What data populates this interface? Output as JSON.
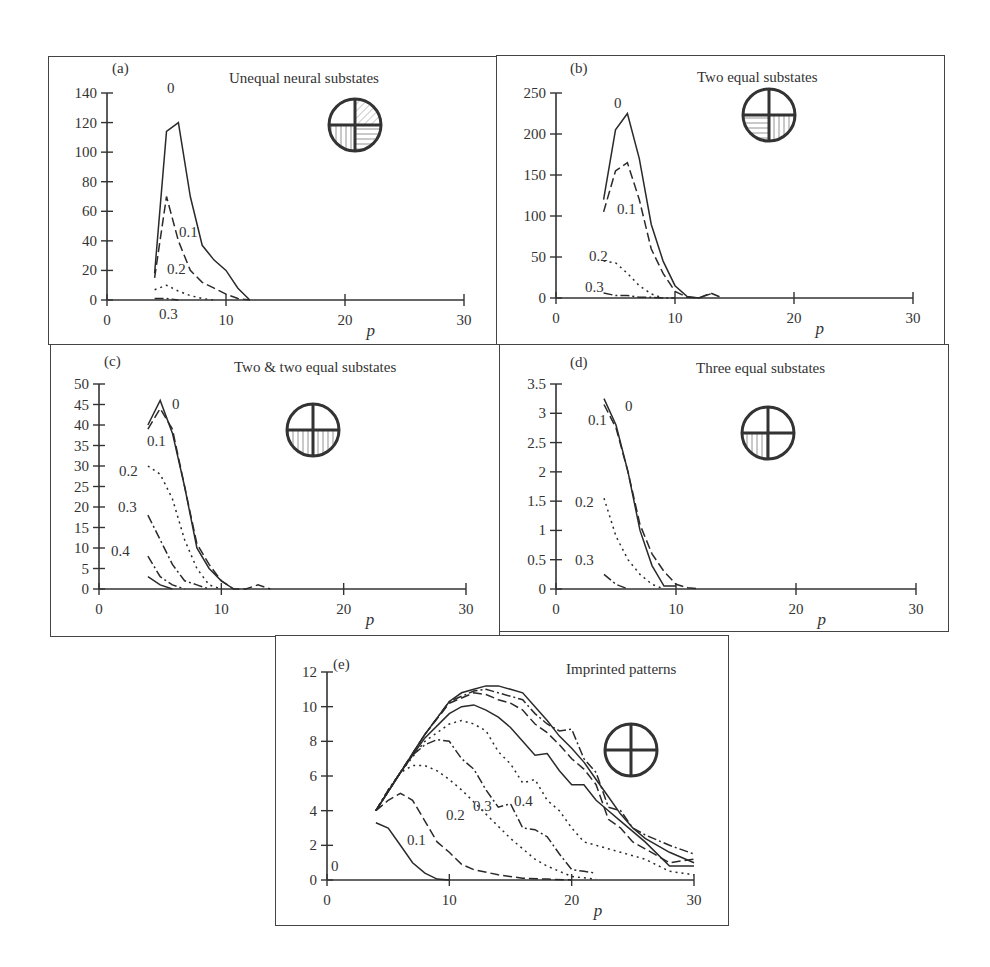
{
  "figure": {
    "panels": [
      {
        "id": "a",
        "label": "(a)",
        "title": "Unequal neural substates",
        "icon": "unequal-substates-icon"
      },
      {
        "id": "b",
        "label": "(b)",
        "title": "Two equal substates",
        "icon": "two-equal-substates-icon"
      },
      {
        "id": "c",
        "label": "(c)",
        "title": "Two & two equal substates",
        "icon": "two-and-two-equal-substates-icon"
      },
      {
        "id": "d",
        "label": "(d)",
        "title": "Three equal substates",
        "icon": "three-equal-substates-icon"
      },
      {
        "id": "e",
        "label": "(e)",
        "title": "Imprinted patterns",
        "icon": "imprinted-patterns-icon"
      }
    ],
    "xlabel": "p"
  },
  "chart_data": [
    {
      "panel": "(a)",
      "type": "line",
      "title": "Unequal neural substates",
      "xlabel": "p",
      "ylabel": "",
      "xlim": [
        0,
        30
      ],
      "ylim": [
        0,
        140
      ],
      "xticks": [
        0,
        10,
        20,
        30
      ],
      "yticks": [
        0,
        20,
        40,
        60,
        80,
        100,
        120,
        140
      ],
      "grid": false,
      "series": [
        {
          "name": "0",
          "style": "solid",
          "x": [
            4,
            5,
            6,
            7,
            8,
            9,
            10,
            11,
            12
          ],
          "values": [
            18,
            114,
            120,
            70,
            37,
            27,
            20,
            8,
            0
          ]
        },
        {
          "name": "0.1",
          "style": "dashed",
          "x": [
            4,
            5,
            6,
            7,
            8,
            9,
            10,
            11,
            12
          ],
          "values": [
            15,
            70,
            40,
            20,
            12,
            8,
            4,
            1,
            0
          ]
        },
        {
          "name": "0.2",
          "style": "dotted",
          "x": [
            4,
            5,
            6,
            7,
            8,
            9
          ],
          "values": [
            7,
            10,
            6,
            3,
            1,
            0
          ]
        },
        {
          "name": "0.3",
          "style": "dashdot",
          "x": [
            4,
            5,
            6
          ],
          "values": [
            1,
            1,
            0
          ]
        }
      ],
      "annotations": [
        "0",
        "0.1",
        "0.2",
        "0.3"
      ]
    },
    {
      "panel": "(b)",
      "type": "line",
      "title": "Two equal substates",
      "xlabel": "p",
      "ylabel": "",
      "xlim": [
        0,
        30
      ],
      "ylim": [
        0,
        250
      ],
      "xticks": [
        0,
        10,
        20,
        30
      ],
      "yticks": [
        0,
        50,
        100,
        150,
        200,
        250
      ],
      "grid": false,
      "series": [
        {
          "name": "0",
          "style": "solid",
          "x": [
            4,
            5,
            6,
            7,
            8,
            9,
            10,
            11,
            12,
            13
          ],
          "values": [
            120,
            205,
            225,
            170,
            90,
            45,
            15,
            2,
            0,
            5
          ]
        },
        {
          "name": "0.1",
          "style": "dashed",
          "x": [
            4,
            5,
            6,
            7,
            8,
            9,
            10,
            11,
            12,
            13,
            14
          ],
          "values": [
            105,
            155,
            165,
            120,
            60,
            30,
            8,
            1,
            0,
            6,
            0
          ]
        },
        {
          "name": "0.2",
          "style": "dotted",
          "x": [
            4,
            5,
            6,
            7,
            8,
            9
          ],
          "values": [
            45,
            43,
            30,
            15,
            5,
            0
          ]
        },
        {
          "name": "0.3",
          "style": "dashdot",
          "x": [
            4,
            5,
            6,
            7,
            8,
            9,
            10
          ],
          "values": [
            6,
            3,
            3,
            1,
            1,
            0,
            0
          ]
        }
      ],
      "annotations": [
        "0",
        "0.1",
        "0.2",
        "0.3"
      ]
    },
    {
      "panel": "(c)",
      "type": "line",
      "title": "Two & two equal substates",
      "xlabel": "p",
      "ylabel": "",
      "xlim": [
        0,
        30
      ],
      "ylim": [
        0,
        50
      ],
      "xticks": [
        0,
        10,
        20,
        30
      ],
      "yticks": [
        0,
        5,
        10,
        15,
        20,
        25,
        30,
        35,
        40,
        45,
        50
      ],
      "grid": false,
      "series": [
        {
          "name": "0",
          "style": "solid",
          "x": [
            4,
            5,
            6,
            7,
            8,
            9,
            10,
            11
          ],
          "values": [
            40,
            46,
            38,
            25,
            10,
            5,
            2,
            0
          ]
        },
        {
          "name": "0.1",
          "style": "dashed",
          "x": [
            4,
            5,
            6,
            7,
            8,
            9,
            10,
            11,
            12,
            13,
            14
          ],
          "values": [
            39,
            44,
            39,
            25,
            11,
            6,
            2,
            0,
            0,
            1,
            0
          ]
        },
        {
          "name": "0.2",
          "style": "dotted",
          "x": [
            4,
            5,
            6,
            7,
            8,
            9,
            10
          ],
          "values": [
            30,
            28,
            22,
            12,
            5,
            1,
            0
          ]
        },
        {
          "name": "0.3",
          "style": "dashdot",
          "x": [
            4,
            5,
            6,
            7,
            8,
            9
          ],
          "values": [
            18,
            12,
            6,
            2,
            1,
            0
          ]
        },
        {
          "name": "0.4",
          "style": "dashdot",
          "x": [
            4,
            5,
            6,
            7
          ],
          "values": [
            8,
            3,
            1,
            0
          ]
        },
        {
          "name": "0.5",
          "style": "solid",
          "x": [
            4,
            5,
            6
          ],
          "values": [
            3,
            1,
            0
          ]
        }
      ],
      "annotations": [
        "0",
        "0.1",
        "0.2",
        "0.3",
        "0.4"
      ]
    },
    {
      "panel": "(d)",
      "type": "line",
      "title": "Three equal substates",
      "xlabel": "p",
      "ylabel": "",
      "xlim": [
        0,
        30
      ],
      "ylim": [
        0,
        3.5
      ],
      "xticks": [
        0,
        10,
        20,
        30
      ],
      "yticks": [
        0,
        0.5,
        1,
        1.5,
        2,
        2.5,
        3,
        3.5
      ],
      "grid": false,
      "series": [
        {
          "name": "0",
          "style": "solid",
          "x": [
            4,
            5,
            6,
            7,
            8,
            9,
            10
          ],
          "values": [
            3.25,
            2.8,
            2.0,
            1.0,
            0.4,
            0.05,
            0.05
          ]
        },
        {
          "name": "0.1",
          "style": "dashed",
          "x": [
            4,
            5,
            6,
            7,
            8,
            9,
            10,
            11,
            12
          ],
          "values": [
            3.15,
            2.75,
            2.0,
            1.1,
            0.6,
            0.3,
            0.08,
            0.02,
            0
          ]
        },
        {
          "name": "0.2",
          "style": "dotted",
          "x": [
            4,
            5,
            6,
            7,
            8,
            9
          ],
          "values": [
            1.55,
            0.9,
            0.5,
            0.25,
            0.08,
            0
          ]
        },
        {
          "name": "0.3",
          "style": "dashdot",
          "x": [
            4,
            5,
            6
          ],
          "values": [
            0.25,
            0.08,
            0
          ]
        }
      ],
      "annotations": [
        "0",
        "0.1",
        "0.2",
        "0.3"
      ]
    },
    {
      "panel": "(e)",
      "type": "line",
      "title": "Imprinted patterns",
      "xlabel": "p",
      "ylabel": "",
      "xlim": [
        0,
        30
      ],
      "ylim": [
        0,
        12
      ],
      "xticks": [
        0,
        10,
        20,
        30
      ],
      "yticks": [
        0,
        2,
        4,
        6,
        8,
        10,
        12
      ],
      "grid": false,
      "series": [
        {
          "name": "0",
          "style": "solid",
          "x": [
            4,
            5,
            6,
            7,
            8,
            9,
            10
          ],
          "values": [
            3.3,
            3.0,
            2.0,
            1.0,
            0.4,
            0.05,
            0
          ]
        },
        {
          "name": "0.1",
          "style": "dashed",
          "x": [
            4,
            5,
            6,
            7,
            8,
            9,
            10,
            11,
            12,
            14,
            16,
            18,
            20
          ],
          "values": [
            4.0,
            4.6,
            5.0,
            4.6,
            3.4,
            2.2,
            1.6,
            0.9,
            0.6,
            0.3,
            0.1,
            0.05,
            0
          ]
        },
        {
          "name": "0.2",
          "style": "dotted",
          "x": [
            4,
            5,
            6,
            7,
            8,
            9,
            10,
            11,
            12,
            13,
            14,
            15,
            16,
            17,
            18,
            19,
            20,
            22
          ],
          "values": [
            4.0,
            5.2,
            6.2,
            6.6,
            6.6,
            6.3,
            5.8,
            5.2,
            4.5,
            3.8,
            3.1,
            2.4,
            1.8,
            1.2,
            0.8,
            0.5,
            0.2,
            0.05
          ]
        },
        {
          "name": "0.3",
          "style": "dashdot",
          "x": [
            4,
            5,
            6,
            7,
            8,
            9,
            10,
            11,
            12,
            13,
            14,
            15,
            16,
            17,
            18,
            19,
            20,
            21,
            22
          ],
          "values": [
            4.0,
            5.2,
            6.2,
            7.2,
            7.8,
            8.1,
            8.0,
            7.0,
            6.4,
            5.2,
            4.2,
            4.4,
            3.0,
            2.9,
            2.5,
            1.5,
            0.6,
            0.5,
            0.4
          ]
        },
        {
          "name": "0.4",
          "style": "dotted",
          "x": [
            4,
            6,
            8,
            10,
            11,
            12,
            13,
            14,
            15,
            16,
            17,
            18,
            19,
            20,
            21,
            22,
            24,
            26,
            28,
            30
          ],
          "values": [
            4.0,
            6.2,
            8.0,
            9.0,
            9.2,
            9.0,
            8.6,
            7.4,
            6.7,
            5.6,
            5.8,
            4.6,
            4.0,
            3.0,
            2.2,
            2.0,
            1.6,
            1.2,
            0.5,
            0.3
          ]
        },
        {
          "name": "0.5",
          "style": "solid",
          "x": [
            4,
            6,
            8,
            10,
            11,
            12,
            13,
            14,
            15,
            16,
            17,
            18,
            19,
            20,
            21,
            22,
            23,
            24,
            26,
            28,
            30
          ],
          "values": [
            4.0,
            6.2,
            8.2,
            9.6,
            10.0,
            10.1,
            9.8,
            9.4,
            8.8,
            8.0,
            7.2,
            7.3,
            6.3,
            5.5,
            5.5,
            4.6,
            4.0,
            3.4,
            2.2,
            0.8,
            0.8
          ]
        },
        {
          "name": "0.6",
          "style": "dashed",
          "x": [
            4,
            6,
            8,
            10,
            11,
            12,
            13,
            14,
            15,
            16,
            17,
            18,
            19,
            20,
            21,
            22,
            23,
            24,
            25,
            26,
            28,
            30
          ],
          "values": [
            4.0,
            6.2,
            8.4,
            10.2,
            10.5,
            10.8,
            10.7,
            10.4,
            10.2,
            9.8,
            9.0,
            8.5,
            7.8,
            7.0,
            6.4,
            5.5,
            3.5,
            3.0,
            2.2,
            1.8,
            1.0,
            1.2
          ]
        },
        {
          "name": "0.7",
          "style": "dashdot",
          "x": [
            4,
            6,
            8,
            10,
            11,
            12,
            13,
            14,
            15,
            16,
            17,
            18,
            19,
            20,
            21,
            22,
            23,
            24,
            25,
            26,
            28,
            30
          ],
          "values": [
            4.0,
            6.2,
            8.4,
            10.3,
            10.6,
            10.9,
            11.0,
            10.8,
            10.6,
            10.4,
            9.6,
            9.0,
            8.6,
            8.7,
            7.0,
            6.2,
            4.2,
            4.0,
            3.0,
            2.6,
            2.0,
            1.5
          ]
        },
        {
          "name": "0.8",
          "style": "solid",
          "x": [
            4,
            6,
            8,
            10,
            11,
            12,
            13,
            14,
            15,
            16,
            17,
            18,
            19,
            20,
            21,
            22,
            23,
            24,
            25,
            26,
            28,
            30
          ],
          "values": [
            4.0,
            6.2,
            8.4,
            10.3,
            10.8,
            11.0,
            11.2,
            11.2,
            11.0,
            10.8,
            10.0,
            9.2,
            8.3,
            7.6,
            6.8,
            5.8,
            4.8,
            3.8,
            3.0,
            2.4,
            1.6,
            1.0
          ]
        }
      ],
      "annotations": [
        "0",
        "0.1",
        "0.2",
        "0.3",
        "0.4"
      ]
    }
  ]
}
